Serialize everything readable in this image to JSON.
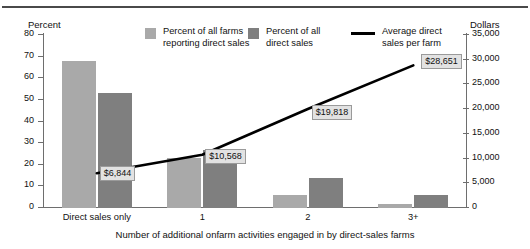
{
  "chart_data": {
    "type": "bar",
    "title": "",
    "subtitle": "",
    "xlabel": "Number of additional onfarm activities engaged in by direct-sales farms",
    "categories": [
      "Direct sales only",
      "1",
      "2",
      "3+"
    ],
    "left_axis": {
      "label": "Percent",
      "ticks": [
        "0",
        "10",
        "20",
        "30",
        "40",
        "50",
        "60",
        "70",
        "80"
      ],
      "ylim": [
        0,
        80
      ]
    },
    "right_axis": {
      "label": "Dollars",
      "ticks": [
        "0",
        "5,000",
        "10,000",
        "15,000",
        "20,000",
        "25,000",
        "30,000",
        "35,000"
      ],
      "ylim": [
        0,
        35000
      ]
    },
    "grid": false,
    "legend_position": "top-center",
    "series": [
      {
        "name": "Percent of all farms reporting direct sales",
        "type": "bar",
        "axis": "left",
        "color": "#a9a9a9",
        "values": [
          68,
          23,
          6,
          2
        ]
      },
      {
        "name": "Percent of all direct sales",
        "type": "bar",
        "axis": "left",
        "color": "#7f7f7f",
        "values": [
          53,
          27,
          14,
          6
        ]
      },
      {
        "name": "Average direct sales per farm",
        "type": "line",
        "axis": "right",
        "color": "#000000",
        "values": [
          6844,
          10568,
          19818,
          28651
        ],
        "labels": [
          "$6,844",
          "$10,568",
          "$19,818",
          "$28,651"
        ]
      }
    ]
  },
  "legend": {
    "entries": [
      {
        "label_line1": "Percent of all farms",
        "label_line2": "reporting direct sales",
        "marker": "swatch-light"
      },
      {
        "label_line1": "Percent of all",
        "label_line2": "direct sales",
        "marker": "swatch-dark"
      },
      {
        "label_line1": "Average direct",
        "label_line2": "sales per farm",
        "marker": "line-black"
      }
    ]
  },
  "colors": {
    "light_bar": "#a9a9a9",
    "dark_bar": "#7f7f7f",
    "line": "#000000",
    "axis": "#6e6e6e",
    "label_bg": "#e2e2e2"
  }
}
